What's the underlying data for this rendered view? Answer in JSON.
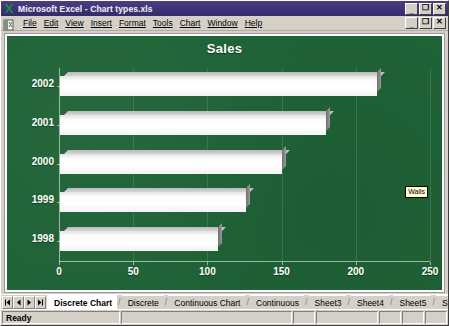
{
  "window": {
    "title": "Microsoft Excel - Chart types.xls",
    "app_icon": "excel-icon",
    "buttons": {
      "minimize": "_",
      "restore": "❐",
      "close": "✕"
    }
  },
  "menu": {
    "items": [
      {
        "label": "File"
      },
      {
        "label": "Edit"
      },
      {
        "label": "View"
      },
      {
        "label": "Insert"
      },
      {
        "label": "Format"
      },
      {
        "label": "Tools"
      },
      {
        "label": "Chart"
      },
      {
        "label": "Window"
      },
      {
        "label": "Help"
      }
    ],
    "doc_buttons": {
      "minimize": "_",
      "restore": "❐",
      "close": "✕"
    }
  },
  "chart_data": {
    "type": "bar",
    "orientation": "horizontal",
    "title": "Sales",
    "categories": [
      "2002",
      "2001",
      "2000",
      "1999",
      "1998"
    ],
    "values": [
      214,
      180,
      150,
      126,
      107
    ],
    "series": [
      {
        "name": "Sales",
        "values": [
          214,
          180,
          150,
          126,
          107
        ]
      }
    ],
    "xlabel": "",
    "ylabel": "",
    "xlim": [
      0,
      250
    ],
    "xticks": [
      0,
      50,
      100,
      150,
      200,
      250
    ],
    "xtick_labels": [
      "0",
      "50",
      "100",
      "150",
      "200",
      "250"
    ],
    "grid": false,
    "legend": "none",
    "style": {
      "plot_background": "#1f6236",
      "bar_color": "#ffffff",
      "bar_shadow_color": "#7a7a7a",
      "text_color": "#ffffff",
      "effect": "3-D clustered bar"
    }
  },
  "tooltip": {
    "text": "Walls",
    "visible": true
  },
  "sheet_tabs": {
    "nav": {
      "first": "⏮",
      "prev": "◀",
      "next": "▶",
      "last": "⏭"
    },
    "items": [
      {
        "label": "Discrete Chart",
        "active": true
      },
      {
        "label": "Discrete",
        "active": false
      },
      {
        "label": "Continuous Chart",
        "active": false
      },
      {
        "label": "Continuous",
        "active": false
      },
      {
        "label": "Sheet3",
        "active": false
      },
      {
        "label": "Sheet4",
        "active": false
      },
      {
        "label": "Sheet5",
        "active": false
      },
      {
        "label": "Sheet6",
        "active": false
      },
      {
        "label": "Sheet7",
        "active": false
      }
    ]
  },
  "status_bar": {
    "message": "Ready",
    "cells": [
      "",
      "",
      "",
      "",
      "",
      ""
    ]
  }
}
